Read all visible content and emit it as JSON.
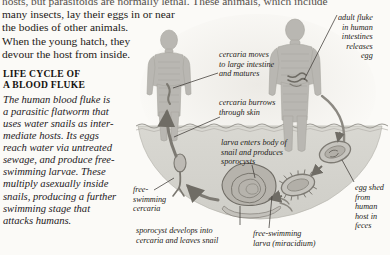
{
  "page": {
    "background_color": "#fbfaf7",
    "text_color": "#1c1916"
  },
  "running_text": {
    "lines": [
      "hosts, but parasitoids are normally lethal. These animals, which include",
      "many insects, lay their eggs in or near",
      "the bodies of other animals.",
      "When the young hatch, they",
      "devour the host from inside."
    ]
  },
  "caption": {
    "heading_lines": [
      "LIFE CYCLE OF",
      "A BLOOD FLUKE"
    ],
    "body_lines": [
      "The human blood fluke is",
      "a parasitic flatworm that",
      "uses water snails as inter-",
      "mediate hosts. Its eggs",
      "reach water via untreated",
      "sewage, and produce free-",
      "swimming larvae. These",
      "multiply asexually inside",
      "snails, producing a further",
      "swimming stage that",
      "attacks humans."
    ]
  },
  "diagram": {
    "colors": {
      "body_fill": "#b9b7b2",
      "body_shade": "#a5a39d",
      "water_fill": "#d3d2cc",
      "water_edge": "#9d9b95",
      "organism": "#8e8b84",
      "leader_line": "#4a4641",
      "arrow": "#6f6c65",
      "halo": "#e6e5e0"
    },
    "annotations": [
      {
        "name": "adult-fluke",
        "lines": [
          "adult fluke",
          "in human",
          "intestines",
          "releases",
          "egg"
        ]
      },
      {
        "name": "cercaria-moves",
        "lines": [
          "cercaria moves",
          "to large intestine",
          "and matures"
        ]
      },
      {
        "name": "cercaria-burrows",
        "lines": [
          "cercaria burrows",
          "through skin"
        ]
      },
      {
        "name": "larva-enters-snail",
        "lines": [
          "larva enters body of",
          "snail and produces",
          "sporocysts"
        ]
      },
      {
        "name": "free-swimming-cercaria",
        "lines": [
          "free-",
          "swimming",
          "cercaria"
        ]
      },
      {
        "name": "sporocyst-develops",
        "lines": [
          "sporocyst develops into",
          "cercaria and leaves snail"
        ]
      },
      {
        "name": "free-swimming-larva",
        "lines": [
          "free-swimming",
          "larva (miracidium)"
        ]
      },
      {
        "name": "egg-shed",
        "lines": [
          "egg shed",
          "from",
          "human",
          "host in",
          "feces"
        ]
      }
    ]
  }
}
